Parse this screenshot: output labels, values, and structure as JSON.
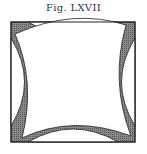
{
  "figure": {
    "caption": "Fig. LXVII",
    "colors": {
      "shade": "#6e6e6e",
      "line": "#222222",
      "background": "#ffffff"
    }
  }
}
